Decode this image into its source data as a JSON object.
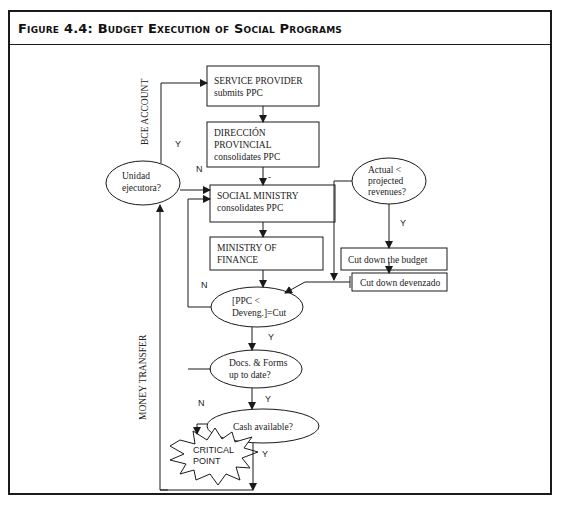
{
  "figure": {
    "title": "Figure 4.4: Budget Execution of Social Programs"
  },
  "nodes": {
    "service_provider": {
      "line1": "SERVICE PROVIDER",
      "line2": "submits PPC"
    },
    "direccion_provincial": {
      "line1": "DIRECCIÓN",
      "line2": "PROVINCIAL",
      "line3": "consolidates PPC"
    },
    "social_ministry": {
      "line1": "SOCIAL MINISTRY",
      "line2": "consolidates PPC"
    },
    "ministry_finance": {
      "line1": "MINISTRY OF",
      "line2": "FINANCE"
    },
    "unidad_ejecutora": {
      "line1": "Unidad",
      "line2": "ejecutora?"
    },
    "actual_projected": {
      "line1": "Actual <",
      "line2": "projected",
      "line3": "revenues?"
    },
    "cut_budget": {
      "label": "Cut down the budget"
    },
    "cut_devenzado": {
      "label": "Cut down devenzado"
    },
    "ppc_deveng": {
      "line1": "[PPC <",
      "line2": "Deveng.]=Cut"
    },
    "docs_forms": {
      "line1": "Docs. & Forms",
      "line2": "up to date?"
    },
    "cash_available": {
      "label": "Cash available?"
    },
    "critical_point": {
      "line1": "CRITICAL",
      "line2": "POINT"
    }
  },
  "edge_labels": {
    "bce_account": "BCE ACCOUNT",
    "money_transfer": "MONEY TRANSFER",
    "y_unidad": "Y",
    "n_unidad": "N",
    "dash": "-",
    "y_actual": "Y",
    "n_ppc": "N",
    "y_ppc": "Y",
    "y_docs": "Y",
    "n_cash": "N",
    "y_cash": "Y"
  },
  "colors": {
    "line": "#1a1a1a",
    "text": "#222222",
    "background": "#ffffff"
  }
}
